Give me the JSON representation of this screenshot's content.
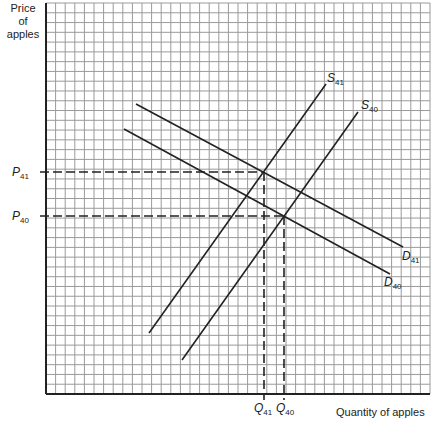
{
  "axes": {
    "y_label_lines": [
      "Price",
      "of",
      "apples"
    ],
    "x_label": "Quantity of apples"
  },
  "price_labels": {
    "p41": {
      "letter": "P",
      "sub": "41"
    },
    "p40": {
      "letter": "P",
      "sub": "40"
    }
  },
  "quantity_labels": {
    "q41": {
      "letter": "Q",
      "sub": "41"
    },
    "q40": {
      "letter": "Q",
      "sub": "40"
    }
  },
  "curves": {
    "s41": {
      "letter": "S",
      "sub": "41"
    },
    "s40": {
      "letter": "S",
      "sub": "40"
    },
    "d41": {
      "letter": "D",
      "sub": "41"
    },
    "d40": {
      "letter": "D",
      "sub": "40"
    }
  },
  "colors": {
    "grid": "#9a9a9a",
    "axis": "#222222",
    "curve": "#222222"
  }
}
